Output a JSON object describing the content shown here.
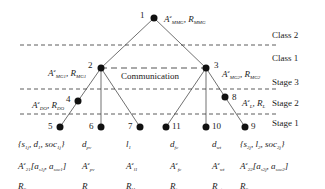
{
  "side_labels": [
    "Class 2",
    "Class 1",
    "Stage 3",
    "Stage 2",
    "Stage 1"
  ],
  "communication_label": "Communication",
  "nodes": [
    {
      "id": "1",
      "label": "A^e_MMG, R_MMG"
    },
    {
      "id": "2",
      "label": "A^e_MG1, R_MG1"
    },
    {
      "id": "3",
      "label": "A^e_MG2, R_MG2"
    },
    {
      "id": "4",
      "label": "A^e_DO, R_DO"
    },
    {
      "id": "8",
      "label": "A^e_L, R_L"
    },
    {
      "id": "5",
      "lines": [
        "{s_1j, d_1, soc_1j}",
        "A^e_21[a_s1j, a_soc1]",
        "R_S"
      ]
    },
    {
      "id": "6",
      "lines": [
        "d_pv",
        "A^e_pv",
        "R_pv"
      ]
    },
    {
      "id": "7",
      "lines": [
        "l_1",
        "A^e_l1",
        "R_l1"
      ]
    },
    {
      "id": "11",
      "lines": [
        "d_fc",
        "A^e_fc",
        "R_fc"
      ]
    },
    {
      "id": "10",
      "lines": [
        "d_wt",
        "A^e_wt",
        "R_wt"
      ]
    },
    {
      "id": "9",
      "lines": [
        "{s_2j, l_2, soc_2j}",
        "A^e_22[a_s2j, a_soc2]",
        "R_S"
      ]
    }
  ],
  "ids": {
    "n1": "1",
    "n2": "2",
    "n3": "3",
    "n4": "4",
    "n5": "5",
    "n6": "6",
    "n7": "7",
    "n8": "8",
    "n9": "9",
    "n10": "10",
    "n11": "11"
  }
}
